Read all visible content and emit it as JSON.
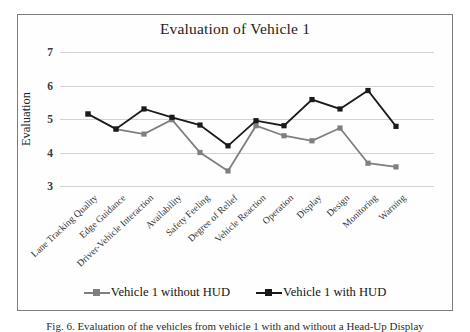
{
  "figure": {
    "caption": "Fig. 6. Evaluation of the vehicles from vehicle 1 with and without a Head-Up Display"
  },
  "chart_data": {
    "type": "line",
    "title": "Evaluation of Vehicle 1",
    "xlabel": "",
    "ylabel": "Evaluation",
    "ylim": [
      3,
      7
    ],
    "yticks": [
      3,
      4,
      5,
      6,
      7
    ],
    "grid": true,
    "legend_position": "bottom",
    "categories": [
      "Lane Tracking Quality",
      "Edge Guidance",
      "Driver-Vehicle Interaction",
      "Availability",
      "Safety Feeling",
      "Degree of Relief",
      "Vehicle Reaction",
      "Operation",
      "Display",
      "Design",
      "Monitoring",
      "Warning"
    ],
    "series": [
      {
        "name": "Vehicle 1 without HUD",
        "color": "#7f7f7f",
        "values": [
          5.15,
          4.7,
          4.55,
          4.98,
          4.0,
          3.45,
          4.8,
          4.5,
          4.35,
          4.73,
          3.68,
          3.57
        ]
      },
      {
        "name": "Vehicle 1 with HUD",
        "color": "#1a1a1a",
        "values": [
          5.15,
          4.7,
          5.3,
          5.05,
          4.82,
          4.2,
          4.95,
          4.8,
          5.58,
          5.3,
          5.85,
          4.78
        ]
      }
    ]
  }
}
